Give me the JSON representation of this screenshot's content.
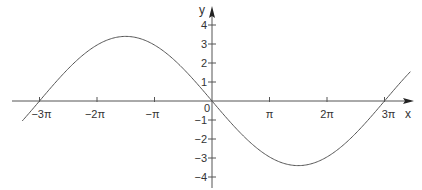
{
  "chart_data": {
    "type": "line",
    "title": "",
    "function": "y = -3.4 sin(x/3)",
    "xlabel": "x",
    "ylabel": "y",
    "xlim": [
      -3.3,
      3.45
    ],
    "xlim_units": "multiples of pi",
    "ylim": [
      -4.5,
      4.9
    ],
    "grid": false,
    "legend": null,
    "x_ticks": [
      {
        "value": -3,
        "label": "−3π"
      },
      {
        "value": -2,
        "label": "−2π"
      },
      {
        "value": -1,
        "label": "−π"
      },
      {
        "value": 1,
        "label": "π"
      },
      {
        "value": 2,
        "label": "2π"
      },
      {
        "value": 3,
        "label": "3π"
      }
    ],
    "y_ticks": [
      {
        "value": 4,
        "label": "4"
      },
      {
        "value": 3,
        "label": "3"
      },
      {
        "value": 2,
        "label": "2"
      },
      {
        "value": 1,
        "label": "1"
      },
      {
        "value": -1,
        "label": "−1"
      },
      {
        "value": -2,
        "label": "−2"
      },
      {
        "value": -3,
        "label": "−3"
      },
      {
        "value": -4,
        "label": "−4"
      }
    ],
    "origin_label": "0",
    "series": [
      {
        "name": "curve",
        "color": "#555555",
        "amplitude": 3.4,
        "period_multiple_of_pi": 6,
        "x_pi": [
          -3.3,
          -3,
          -2.5,
          -2,
          -1.5,
          -1,
          -0.5,
          0,
          0.5,
          1,
          1.5,
          2,
          2.5,
          3,
          3.35
        ],
        "y": [
          1.06,
          0,
          -1.7,
          -2.94,
          -3.4,
          -2.94,
          -1.7,
          0,
          1.7,
          2.94,
          3.4,
          2.94,
          1.7,
          0,
          -1.22
        ],
        "note": "y values given as displayed (positive up); curve passes through 0 at 0 and ±3π, max ≈3.4 at −3π/2, min ≈−3.4 at 3π/2"
      }
    ],
    "extrema": [
      {
        "x_label": "−3π/2",
        "y": 3.4,
        "kind": "max"
      },
      {
        "x_label": "3π/2",
        "y": -3.4,
        "kind": "min"
      }
    ]
  },
  "layout": {
    "origin_px": [
      212,
      101
    ],
    "px_per_pi": 57.5,
    "px_per_unit_y": 19,
    "axis_color": "#555555",
    "curve_color": "#555555"
  }
}
